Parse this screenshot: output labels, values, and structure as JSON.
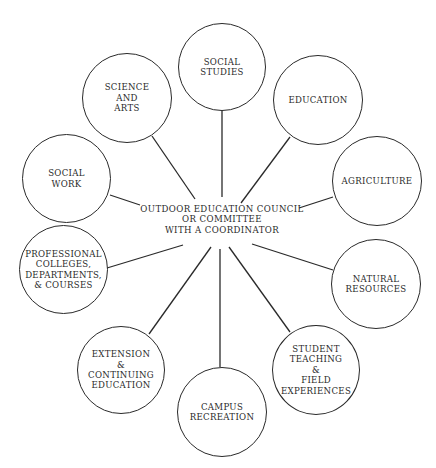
{
  "diagram": {
    "type": "hub-and-spoke",
    "center": {
      "label": "OUTDOOR EDUCATION COUNCIL\nOR COMMITTEE\nWITH A COORDINATOR"
    },
    "nodes": [
      {
        "id": "social-studies",
        "label": "SOCIAL\nSTUDIES"
      },
      {
        "id": "education",
        "label": "EDUCATION"
      },
      {
        "id": "agriculture",
        "label": "AGRICULTURE"
      },
      {
        "id": "natural-resources",
        "label": "NATURAL\nRESOURCES"
      },
      {
        "id": "student-teaching",
        "label": "STUDENT\nTEACHING\n&\nFIELD\nEXPERIENCES"
      },
      {
        "id": "campus-recreation",
        "label": "CAMPUS\nRECREATION"
      },
      {
        "id": "extension",
        "label": "EXTENSION\n&\nCONTINUING\nEDUCATION"
      },
      {
        "id": "professional",
        "label": "PROFESSIONAL\nCOLLEGES,\nDEPARTMENTS,\n& COURSES"
      },
      {
        "id": "social-work",
        "label": "SOCIAL\nWORK"
      },
      {
        "id": "science-arts",
        "label": "SCIENCE\nAND\nARTS"
      }
    ],
    "colors": {
      "line": "#2a2a2a",
      "background": "#ffffff"
    }
  }
}
